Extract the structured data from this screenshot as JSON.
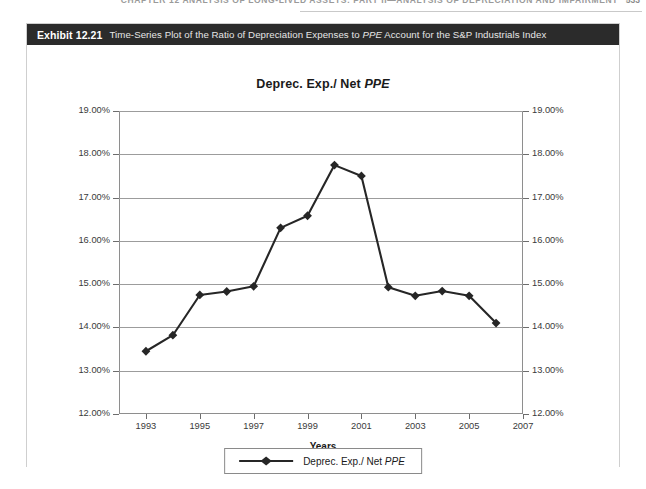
{
  "running_header": {
    "text": "CHAPTER 12  ANALYSIS OF LONG-LIVED ASSETS: PART II—ANALYSIS OF DEPRECIATION AND IMPAIRMENT",
    "page_number": "533"
  },
  "exhibit": {
    "number": "Exhibit 12.21",
    "caption_before_italic": "Time-Series Plot of the Ratio of Depreciation Expenses to ",
    "caption_italic": "PPE",
    "caption_after_italic": " Account for the S&P Industrials Index"
  },
  "chart_title": {
    "plain": "Deprec. Exp./ Net ",
    "italic": "PPE"
  },
  "legend": {
    "label_plain": "Deprec. Exp./ Net ",
    "label_italic": "PPE",
    "marker": "diamond-marker"
  },
  "colors": {
    "series_line": "#262626",
    "marker": "#262626",
    "gridline": "#9c9c9c",
    "axis": "#8e8e8e",
    "title_bar_bg": "#2b2b2b",
    "panel_border": "#cfcfcf",
    "text": "#3a3a3a"
  },
  "chart_data": {
    "type": "line",
    "title": "Deprec. Exp./ Net PPE",
    "xlabel": "Years",
    "ylabel": "",
    "grid": true,
    "legend_position": "bottom-center",
    "dual_y_axis": true,
    "xlim": [
      1992,
      2007
    ],
    "ylim": [
      12.0,
      19.0
    ],
    "ytick_values": [
      12.0,
      13.0,
      14.0,
      15.0,
      16.0,
      17.0,
      18.0,
      19.0
    ],
    "ytick_labels": [
      "12.00%",
      "13.00%",
      "14.00%",
      "15.00%",
      "16.00%",
      "17.00%",
      "18.00%",
      "19.00%"
    ],
    "ytick_labels_right": [
      "12.00%",
      "13.00%",
      "14.00%",
      "15.00%",
      "16.00%",
      "17.00%",
      "18.00%",
      "19.00%"
    ],
    "xtick_values": [
      1993,
      1995,
      1997,
      1999,
      2001,
      2003,
      2005,
      2007
    ],
    "xtick_labels": [
      "1993",
      "1995",
      "1997",
      "1999",
      "2001",
      "2003",
      "2005",
      "2007"
    ],
    "x": [
      1993,
      1994,
      1995,
      1996,
      1997,
      1998,
      1999,
      2000,
      2001,
      2002,
      2003,
      2004,
      2005,
      2006
    ],
    "series": [
      {
        "name": "Deprec. Exp./ Net PPE",
        "values": [
          13.45,
          13.82,
          14.75,
          14.83,
          14.95,
          16.3,
          16.58,
          17.75,
          17.5,
          14.93,
          14.73,
          14.84,
          14.73,
          14.1
        ],
        "marker": "diamond",
        "color": "#262626"
      }
    ]
  }
}
